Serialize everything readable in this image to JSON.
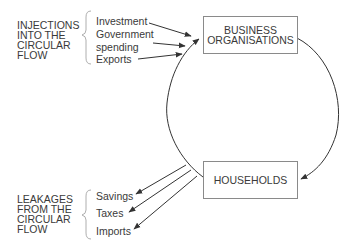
{
  "diagram": {
    "type": "circular-flow",
    "nodes": {
      "business": {
        "label": "BUSINESS\nORGANISATIONS"
      },
      "households": {
        "label": "HOUSEHOLDS"
      }
    },
    "injections": {
      "title": "INJECTIONS\nINTO THE\nCIRCULAR\nFLOW",
      "items": [
        {
          "label": "Investment"
        },
        {
          "label": "Government"
        },
        {
          "label": "spending"
        },
        {
          "label": "Exports"
        }
      ]
    },
    "leakages": {
      "title": "LEAKAGES\nFROM THE\nCIRCULAR\nFLOW",
      "items": [
        {
          "label": "Savings"
        },
        {
          "label": "Taxes"
        },
        {
          "label": "Imports"
        }
      ]
    },
    "edges": [
      {
        "from": "business",
        "to": "households",
        "direction": "clockwise-right-arc"
      },
      {
        "from": "households",
        "to": "business",
        "direction": "left-arc"
      },
      {
        "from": "Investment",
        "to": "business"
      },
      {
        "from": "Government spending",
        "to": "business"
      },
      {
        "from": "Exports",
        "to": "business"
      },
      {
        "from": "circular-flow",
        "to": "Savings"
      },
      {
        "from": "circular-flow",
        "to": "Taxes"
      },
      {
        "from": "circular-flow",
        "to": "Imports"
      }
    ],
    "colors": {
      "line": "#333333",
      "box_border": "#8a8a8a",
      "text": "#3a3a3a"
    }
  }
}
